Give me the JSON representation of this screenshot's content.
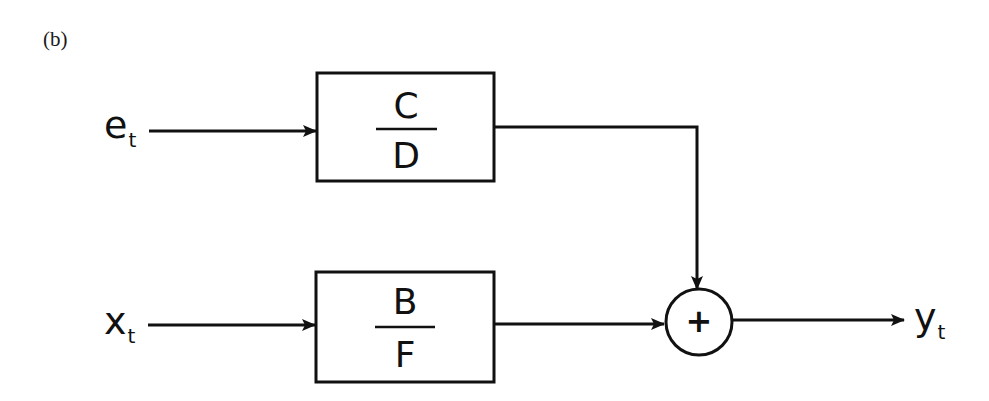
{
  "figure": {
    "panel_label": "(b)",
    "inputs": {
      "noise": {
        "symbol": "e",
        "subscript": "t"
      },
      "exogenous": {
        "symbol": "x",
        "subscript": "t"
      }
    },
    "output": {
      "symbol": "y",
      "subscript": "t"
    },
    "blocks": {
      "noise_filter": {
        "numerator": "C",
        "denominator": "D"
      },
      "transfer_function": {
        "numerator": "B",
        "denominator": "F"
      }
    },
    "summing_junction": {
      "operator": "+"
    },
    "colors": {
      "stroke": "#111111",
      "background": "#ffffff"
    }
  }
}
